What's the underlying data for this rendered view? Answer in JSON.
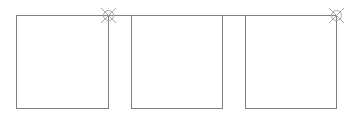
{
  "diagram": {
    "stroke_color": "#808080",
    "marker_color": "#a0a0a0",
    "top_line": {
      "x1": 16,
      "x2": 336,
      "y": 15
    },
    "boxes": [
      {
        "id": "box-1",
        "x": 16,
        "y": 15,
        "w": 92,
        "h": 93
      },
      {
        "id": "box-2",
        "x": 131,
        "y": 15,
        "w": 91,
        "h": 93
      },
      {
        "id": "box-3",
        "x": 245,
        "y": 15,
        "w": 91,
        "h": 93
      }
    ],
    "markers": [
      {
        "id": "marker-1",
        "cx": 108,
        "cy": 15,
        "r": 5
      },
      {
        "id": "marker-2",
        "cx": 336,
        "cy": 15,
        "r": 5
      }
    ]
  }
}
